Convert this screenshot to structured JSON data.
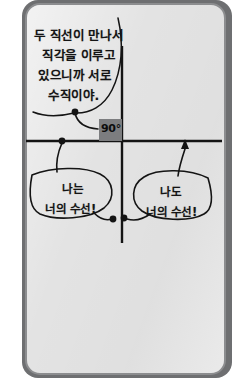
{
  "figure": {
    "kind": "perpendicular-lines-diagram",
    "background_color": "#e3e3e3",
    "page_border_color": "#8c8d8f",
    "ink_color": "#141414",
    "angle_box_color": "#7c7d7f"
  },
  "intro_bubble": {
    "name": "intro-speech-bubble",
    "lines": [
      "두 직선이 만나서",
      "직각을 이루고",
      "있으니까 서로",
      "수직이야."
    ]
  },
  "angle_marker": {
    "name": "right-angle-marker",
    "label": "90°"
  },
  "left_bubble": {
    "name": "left-speech-bubble",
    "lines": [
      "나는",
      "너의 수선!"
    ]
  },
  "right_bubble": {
    "name": "right-speech-bubble",
    "lines": [
      "나도",
      "너의 수선!"
    ]
  },
  "lines": {
    "vertical": {
      "name": "vertical-line",
      "x": 122,
      "y1": 46,
      "y2": 243
    },
    "horizontal": {
      "name": "horizontal-line",
      "y": 141,
      "x1": 26,
      "x2": 222
    }
  }
}
